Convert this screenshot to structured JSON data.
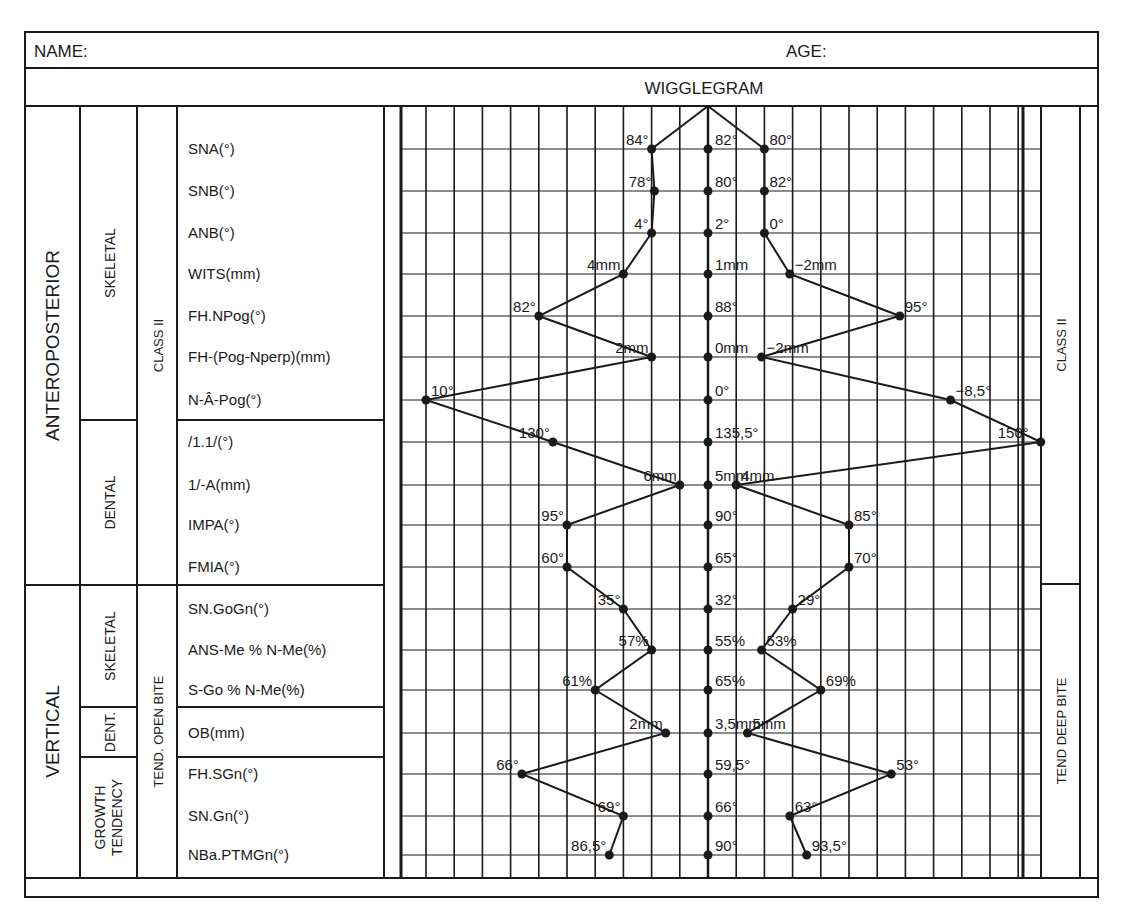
{
  "header": {
    "name_label": "NAME:",
    "age_label": "AGE:",
    "title": "WIGGLEGRAM"
  },
  "left_groups": {
    "major": [
      {
        "label": "ANTEROPOSTERIOR",
        "rows": [
          0,
          10
        ]
      },
      {
        "label": "VERTICAL",
        "rows": [
          11,
          17
        ]
      }
    ],
    "sub": [
      {
        "label": "SKELETAL",
        "rows": [
          0,
          6
        ]
      },
      {
        "label": "DENTAL",
        "rows": [
          7,
          10
        ]
      },
      {
        "label": "SKELETAL",
        "rows": [
          11,
          13
        ]
      },
      {
        "label": "DENT.",
        "rows": [
          14,
          14
        ]
      },
      {
        "label": "GROWTH TENDENCY",
        "lines": [
          "GROWTH",
          "TENDENCY"
        ],
        "rows": [
          15,
          17
        ]
      }
    ],
    "tendency": [
      {
        "label": "CLASS II",
        "rows": [
          0,
          10
        ]
      },
      {
        "label": "TEND. OPEN BITE",
        "rows": [
          11,
          17
        ]
      }
    ]
  },
  "right_groups": [
    {
      "label": "CLASS II",
      "rows": [
        0,
        10
      ]
    },
    {
      "label": "TEND DEEP BITE",
      "rows": [
        11,
        17
      ]
    }
  ],
  "chart_data": {
    "type": "line",
    "title": "WIGGLEGRAM",
    "xlabel": "",
    "ylabel": "",
    "grid": true,
    "legend": "none",
    "left_extreme_label": "CLASS II / TEND. OPEN BITE",
    "right_extreme_label": "CLASS II / TEND DEEP BITE",
    "x_axis_note": "Horizontal position in grid units relative to center norm (0 = norm); grid spacing = 1 unit",
    "categories": [
      "SNA(°)",
      "SNB(°)",
      "ANB(°)",
      "WITS(mm)",
      "FH.NPog(°)",
      "FH-(Pog-Nperp)(mm)",
      "N-Â-Pog(°)",
      "/1.1/(°)",
      "1/-A(mm)",
      "IMPA(°)",
      "FMIA(°)",
      "SN.GoGn(°)",
      "ANS-Me % N-Me(%)",
      "S-Go % N-Me(%)",
      "OB(mm)",
      "FH.SGn(°)",
      "SN.Gn(°)",
      "NBa.PTMGn(°)"
    ],
    "series": [
      {
        "name": "Left extreme (Class II / open bite)",
        "labels": [
          "84°",
          "78°",
          "4°",
          "4mm",
          "82°",
          "2mm",
          "10°",
          "130°",
          "6mm",
          "95°",
          "60°",
          "35°",
          "57%",
          "61%",
          "2mm",
          "66°",
          "69°",
          "86,5°"
        ],
        "x": [
          -2,
          -1.9,
          -2,
          -3,
          -6,
          -2,
          -10,
          -5.5,
          -1,
          -5,
          -5,
          -3,
          -2,
          -4,
          -1.5,
          -6.6,
          -3,
          -3.5
        ]
      },
      {
        "name": "Norm (center)",
        "labels": [
          "82°",
          "80°",
          "2°",
          "1mm",
          "88°",
          "0mm",
          "0°",
          "135,5°",
          "5mm",
          "90°",
          "65°",
          "32°",
          "55%",
          "65%",
          "3,5mm",
          "59,5°",
          "66°",
          "90°"
        ],
        "x": [
          0,
          0,
          0,
          0,
          0,
          0,
          0,
          0,
          0,
          0,
          0,
          0,
          0,
          0,
          0,
          0,
          0,
          0
        ]
      },
      {
        "name": "Right extreme (Class II / deep bite)",
        "labels": [
          "80°",
          "82°",
          "0°",
          "−2mm",
          "95°",
          "−2mm",
          "−8,5°",
          "150°",
          "4mm",
          "85°",
          "70°",
          "29°",
          "53%",
          "69%",
          "5mm",
          "53°",
          "63°",
          "93,5°"
        ],
        "x": [
          2,
          2,
          2,
          2.9,
          6.8,
          1.9,
          8.6,
          11.8,
          1,
          5,
          5,
          3,
          1.9,
          4,
          1.4,
          6.5,
          2.9,
          3.5
        ]
      }
    ]
  },
  "styles": {
    "ink": "#1a1a1a",
    "paper": "#ffffff"
  }
}
